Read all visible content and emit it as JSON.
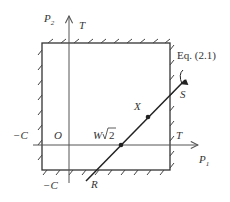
{
  "diagram": {
    "axes": {
      "vertical": {
        "label": "P",
        "subscript": "2",
        "secondary_label": "T"
      },
      "horizontal": {
        "label": "P",
        "subscript": "1",
        "secondary_label": "T"
      }
    },
    "labels": {
      "origin": "O",
      "neg_c_horizontal": "−C",
      "neg_c_vertical": "−C",
      "equation_ref": "Eq. (2.1)",
      "point_s": "S",
      "point_r": "R",
      "point_x": "X",
      "point_w": "W",
      "sqrt_two": "2"
    },
    "colors": {
      "line": "#333333",
      "axis": "#555555",
      "text": "#333333"
    }
  }
}
